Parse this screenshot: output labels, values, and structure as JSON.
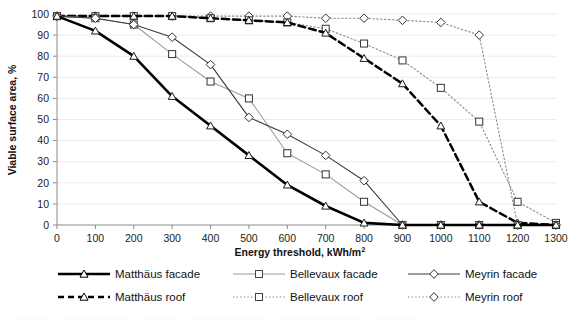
{
  "chart_data": {
    "type": "line",
    "title": "",
    "xlabel": "Energy threshold, kWh/m²",
    "ylabel": "Viable surface area, %",
    "xlim": [
      0,
      1300
    ],
    "ylim": [
      0,
      100
    ],
    "xticks": [
      0,
      100,
      200,
      300,
      400,
      500,
      600,
      700,
      800,
      900,
      1000,
      1100,
      1200,
      1300
    ],
    "yticks": [
      0,
      10,
      20,
      30,
      40,
      50,
      60,
      70,
      80,
      90,
      100
    ],
    "grid": "horizontal",
    "legend_position": "bottom",
    "x": [
      0,
      100,
      200,
      300,
      400,
      500,
      600,
      700,
      800,
      900,
      1000,
      1100,
      1200,
      1300
    ],
    "series": [
      {
        "name": "Matthäus facade",
        "marker": "triangle",
        "line": "solid-thick",
        "color": "#000000",
        "values": [
          99,
          92,
          80,
          61,
          47,
          33,
          19,
          9,
          1,
          0,
          0,
          0,
          0,
          0
        ]
      },
      {
        "name": "Bellevaux facade",
        "marker": "square",
        "line": "solid-thin-gray",
        "color": "#9a9a9a",
        "values": [
          99,
          98,
          95,
          81,
          68,
          60,
          34,
          24,
          11,
          0,
          0,
          0,
          0,
          0
        ]
      },
      {
        "name": "Meyrin facade",
        "marker": "diamond",
        "line": "solid-thin",
        "color": "#3a3a3a",
        "values": [
          99,
          98,
          95,
          89,
          76,
          51,
          43,
          33,
          21,
          0,
          0,
          0,
          0,
          0
        ]
      },
      {
        "name": "Matthäus roof",
        "marker": "triangle",
        "line": "dashed-thick",
        "color": "#000000",
        "values": [
          99,
          99,
          99,
          99,
          98,
          97,
          96,
          91,
          79,
          67,
          47,
          11,
          1,
          0
        ]
      },
      {
        "name": "Bellevaux roof",
        "marker": "square",
        "line": "dotted",
        "color": "#6e6e6e",
        "values": [
          99,
          99,
          99,
          99,
          98,
          97,
          96,
          93,
          86,
          78,
          65,
          49,
          11,
          1
        ]
      },
      {
        "name": "Meyrin roof",
        "marker": "diamond",
        "line": "dotted",
        "color": "#6e6e6e",
        "values": [
          99,
          99,
          99,
          99,
          99,
          99,
          99,
          98,
          98,
          97,
          96,
          90,
          0,
          0
        ]
      }
    ]
  },
  "axes": {
    "y_title": "Viable surface area, %",
    "x_title_main": "Energy threshold, kWh/m",
    "x_title_sup": "2",
    "y_tick_labels": [
      "100",
      "90",
      "80",
      "70",
      "60",
      "50",
      "40",
      "30",
      "20",
      "10",
      "0"
    ],
    "x_tick_labels": [
      "0",
      "100",
      "200",
      "300",
      "400",
      "500",
      "600",
      "700",
      "800",
      "900",
      "1000",
      "1100",
      "1200",
      "1300"
    ]
  },
  "legend": {
    "row1": [
      {
        "label": "Matthäus facade",
        "key": "key-solid-thick-triangle"
      },
      {
        "label": "Bellevaux facade",
        "key": "key-solid-gray-square"
      },
      {
        "label": "Meyrin facade",
        "key": "key-solid-thin-diamond"
      }
    ],
    "row2": [
      {
        "label": "Matthäus roof",
        "key": "key-dashed-triangle"
      },
      {
        "label": "Bellevaux roof",
        "key": "key-dotted-square"
      },
      {
        "label": "Meyrin roof",
        "key": "key-dotted-diamond"
      }
    ]
  }
}
